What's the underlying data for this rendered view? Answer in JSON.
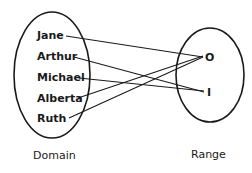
{
  "diagram": {
    "type": "mapping",
    "domain": {
      "caption": "Domain",
      "items": [
        "Jane",
        "Arthur",
        "Michael",
        "Alberta",
        "Ruth"
      ]
    },
    "range": {
      "caption": "Range",
      "items": [
        "O",
        "I"
      ]
    },
    "mappings": [
      {
        "from": "Jane",
        "to": "O"
      },
      {
        "from": "Arthur",
        "to": "I"
      },
      {
        "from": "Michael",
        "to": "I"
      },
      {
        "from": "Alberta",
        "to": "O"
      },
      {
        "from": "Ruth",
        "to": "O"
      }
    ],
    "colors": {
      "stroke": "#1a1a1a",
      "background": "#ffffff"
    }
  }
}
